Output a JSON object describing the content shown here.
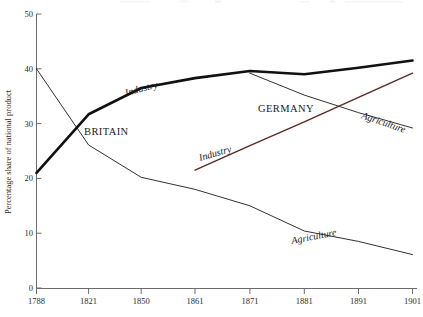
{
  "chart_data": {
    "type": "line",
    "title": "",
    "xlabel": "",
    "ylabel": "Percentage share of national product",
    "xlim": [
      1788,
      1901
    ],
    "ylim": [
      0,
      50
    ],
    "grid": false,
    "legend": "inline-annotations",
    "x_ticks": [
      1788,
      1821,
      1850,
      1861,
      1871,
      1881,
      1891,
      1901
    ],
    "y_ticks": [
      0,
      10,
      20,
      30,
      40,
      50
    ],
    "series": [
      {
        "name": "Britain Industry",
        "country": "BRITAIN",
        "sector": "Industry",
        "style": "thick-black",
        "color": "#111111",
        "width": 2.6,
        "x": [
          1788,
          1821,
          1850,
          1861,
          1871,
          1881,
          1891,
          1901
        ],
        "values": [
          21,
          31.7,
          36.5,
          38.3,
          39.6,
          39.0,
          40.2,
          41.5
        ]
      },
      {
        "name": "Britain Agriculture",
        "country": "BRITAIN",
        "sector": "Agriculture",
        "style": "thin-black",
        "color": "#1a1a1a",
        "width": 0.9,
        "x": [
          1788,
          1821,
          1850,
          1861,
          1871,
          1881,
          1891,
          1901
        ],
        "values": [
          40,
          26.1,
          20.2,
          18.0,
          15.0,
          10.4,
          8.5,
          6.1
        ]
      },
      {
        "name": "Germany Industry",
        "country": "GERMANY",
        "sector": "Industry",
        "style": "thin-maroon",
        "color": "#5c2a22",
        "width": 1.4,
        "x": [
          1861,
          1871,
          1881,
          1891,
          1901
        ],
        "values": [
          21.5,
          26.0,
          30.3,
          34.8,
          39.2
        ]
      },
      {
        "name": "Germany Agriculture",
        "country": "GERMANY",
        "sector": "Agriculture",
        "style": "thin-black",
        "color": "#1a1a1a",
        "width": 0.9,
        "x": [
          1871,
          1881,
          1891,
          1901
        ],
        "values": [
          39.2,
          35.2,
          32.0,
          29.2
        ]
      }
    ],
    "annotations": [
      {
        "text": "Industry",
        "ref": "Britain Industry",
        "x_px": 126,
        "y_px": 96,
        "rotation": -15
      },
      {
        "text": "BRITAIN",
        "ref": "BRITAIN",
        "x_px": 84,
        "y_px": 135,
        "rotation": 0
      },
      {
        "text": "Agriculture",
        "ref": "Britain Agriculture",
        "x_px": 292,
        "y_px": 244,
        "rotation": -11
      },
      {
        "text": "Industry",
        "ref": "Germany Industry",
        "x_px": 200,
        "y_px": 161,
        "rotation": -16
      },
      {
        "text": "GERMANY",
        "ref": "GERMANY",
        "x_px": 258,
        "y_px": 112,
        "rotation": 0
      },
      {
        "text": "Agriculture",
        "ref": "Germany Agriculture",
        "x_px": 361,
        "y_px": 118,
        "rotation": 19
      }
    ]
  },
  "axes": {
    "y_title": "Percentage share of national product",
    "y_tick_labels": [
      "50",
      "40",
      "30",
      "20",
      "10",
      "0"
    ],
    "x_tick_labels": [
      "1788",
      "1821",
      "1850",
      "1861",
      "1871",
      "1881",
      "1891",
      "1901"
    ],
    "axis_color": "#5a5a5a"
  },
  "colors": {
    "background": "#ffffff",
    "britain_industry": "#111111",
    "germany_industry": "#5c2a22",
    "thin_line": "#1a1a1a",
    "axis": "#5a5a5a",
    "text": "#1a1a1a"
  }
}
